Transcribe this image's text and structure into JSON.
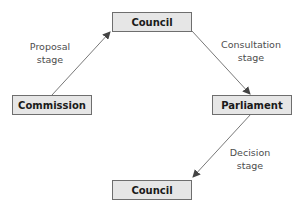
{
  "diagram": {
    "nodes": [
      {
        "id": "commission",
        "label": "Commission"
      },
      {
        "id": "council_top",
        "label": "Council"
      },
      {
        "id": "parliament",
        "label": "Parliament"
      },
      {
        "id": "council_bottom",
        "label": "Council"
      }
    ],
    "edges": [
      {
        "from": "commission",
        "to": "council_top",
        "label_line1": "Proposal",
        "label_line2": "stage"
      },
      {
        "from": "council_top",
        "to": "parliament",
        "label_line1": "Consultation",
        "label_line2": "stage"
      },
      {
        "from": "parliament",
        "to": "council_bottom",
        "label_line1": "Decision",
        "label_line2": "stage"
      }
    ]
  },
  "colors": {
    "box_fill": "#e6e6e6",
    "box_border": "#6e6e6e",
    "arrow": "#444444"
  }
}
